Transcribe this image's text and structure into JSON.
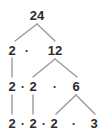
{
  "figure": {
    "kind": "factor-tree",
    "root_value": "24",
    "background_color": "#ffffff",
    "text_color": "#2b2b2b",
    "line_color": "#8c8c8c"
  },
  "rows": [
    {
      "index": 0,
      "expression": "24",
      "nodes": [
        {
          "label": "24",
          "x": 37,
          "y": 9
        }
      ],
      "operators": []
    },
    {
      "index": 1,
      "expression": "2 · 12",
      "nodes": [
        {
          "label": "2",
          "x": 12,
          "y": 44
        },
        {
          "label": "12",
          "x": 55,
          "y": 44
        }
      ],
      "operators": [
        {
          "label": "·",
          "x": 27,
          "y": 44
        }
      ]
    },
    {
      "index": 2,
      "expression": "2 · 2 · 6",
      "nodes": [
        {
          "label": "2",
          "x": 12,
          "y": 80
        },
        {
          "label": "2",
          "x": 33,
          "y": 80
        },
        {
          "label": "6",
          "x": 76,
          "y": 80
        }
      ],
      "operators": [
        {
          "label": "·",
          "x": 23,
          "y": 80
        },
        {
          "label": "·",
          "x": 55,
          "y": 80
        }
      ]
    },
    {
      "index": 3,
      "expression": "2 · 2 · 2 · 3",
      "nodes": [
        {
          "label": "2",
          "x": 12,
          "y": 117
        },
        {
          "label": "2",
          "x": 33,
          "y": 117
        },
        {
          "label": "2",
          "x": 54,
          "y": 117
        },
        {
          "label": "3",
          "x": 94,
          "y": 117
        }
      ],
      "operators": [
        {
          "label": "·",
          "x": 23,
          "y": 117
        },
        {
          "label": "·",
          "x": 44,
          "y": 117
        },
        {
          "label": "·",
          "x": 74,
          "y": 117
        }
      ]
    }
  ],
  "edges": {
    "branch_color": "#9a9a9a",
    "stroke_width": 1.4,
    "segments": [
      {
        "name": "root-to-2",
        "x1": 37,
        "y1": 24,
        "x2": 15,
        "y2": 41
      },
      {
        "name": "root-to-12",
        "x1": 37,
        "y1": 24,
        "x2": 55,
        "y2": 41
      },
      {
        "name": "carry-2-r1",
        "x1": 12,
        "y1": 58,
        "x2": 12,
        "y2": 77
      },
      {
        "name": "12-to-2",
        "x1": 55,
        "y1": 59,
        "x2": 33,
        "y2": 77
      },
      {
        "name": "12-to-6",
        "x1": 55,
        "y1": 59,
        "x2": 77,
        "y2": 77
      },
      {
        "name": "carry-2a-r2",
        "x1": 12,
        "y1": 95,
        "x2": 12,
        "y2": 114
      },
      {
        "name": "carry-2b-r2",
        "x1": 33,
        "y1": 95,
        "x2": 33,
        "y2": 114
      },
      {
        "name": "6-to-2",
        "x1": 76,
        "y1": 95,
        "x2": 56,
        "y2": 114
      },
      {
        "name": "6-to-3",
        "x1": 76,
        "y1": 95,
        "x2": 95,
        "y2": 114
      }
    ]
  }
}
